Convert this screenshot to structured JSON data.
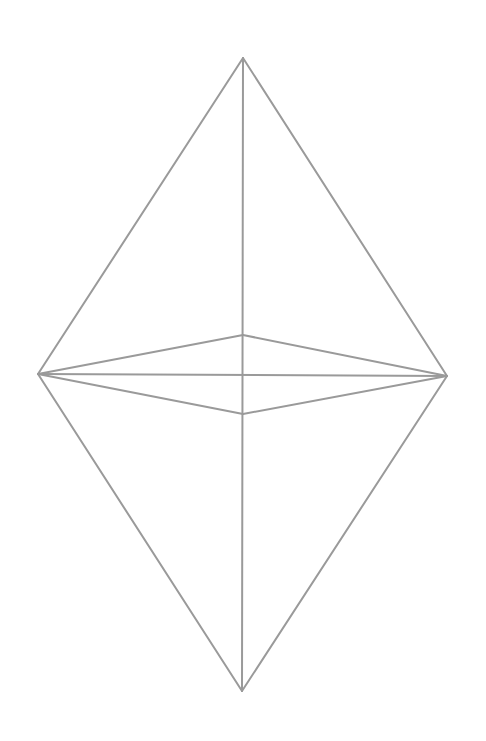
{
  "diagram": {
    "type": "octahedron-wireframe",
    "background": "#ffffff",
    "stroke_color": "#9a9a9a",
    "stroke_width": 2,
    "vertices": {
      "top": [
        243,
        58
      ],
      "bottom": [
        242,
        691
      ],
      "left": [
        38,
        374
      ],
      "right": [
        447,
        376
      ],
      "front": [
        243,
        414
      ],
      "back": [
        243,
        335
      ]
    },
    "edges": [
      {
        "name": "top-left",
        "from": "top",
        "to": "left"
      },
      {
        "name": "top-right",
        "from": "top",
        "to": "right"
      },
      {
        "name": "bottom-left",
        "from": "bottom",
        "to": "left"
      },
      {
        "name": "bottom-right",
        "from": "bottom",
        "to": "right"
      },
      {
        "name": "vertical-axis",
        "from": "top",
        "to": "bottom"
      },
      {
        "name": "horizontal-axis",
        "from": "left",
        "to": "right"
      },
      {
        "name": "left-back",
        "from": "left",
        "to": "back"
      },
      {
        "name": "back-right",
        "from": "back",
        "to": "right"
      },
      {
        "name": "left-front",
        "from": "left",
        "to": "front"
      },
      {
        "name": "front-right",
        "from": "front",
        "to": "right"
      }
    ]
  }
}
